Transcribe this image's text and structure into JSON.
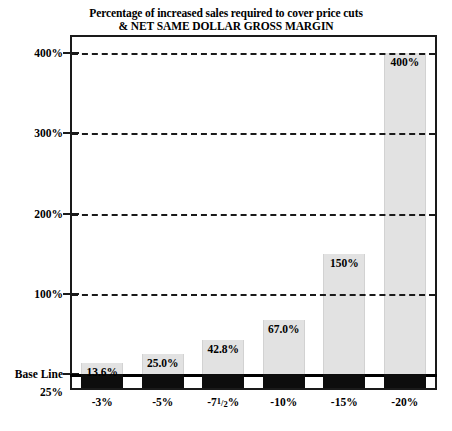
{
  "chart_data": {
    "type": "bar",
    "title": "Percentage of increased sales required to cover price cuts",
    "subtitle": "& NET SAME DOLLAR GROSS MARGIN",
    "xlabel": "",
    "ylabel": "",
    "ylim": [
      0,
      400
    ],
    "grid": true,
    "legend": "none",
    "categories": [
      "-3%",
      "-5%",
      "-7¹/₂%",
      "-10%",
      "-15%",
      "-20%"
    ],
    "category_labels_parts": [
      {
        "pre": "-3%",
        "num": "",
        "den": "",
        "post": ""
      },
      {
        "pre": "-5%",
        "num": "",
        "den": "",
        "post": ""
      },
      {
        "pre": "-7",
        "num": "1",
        "den": "2",
        "post": "%"
      },
      {
        "pre": "-10%",
        "num": "",
        "den": "",
        "post": ""
      },
      {
        "pre": "-15%",
        "num": "",
        "den": "",
        "post": ""
      },
      {
        "pre": "-20%",
        "num": "",
        "den": "",
        "post": ""
      }
    ],
    "values": [
      13.6,
      25.0,
      42.8,
      67.0,
      150,
      400
    ],
    "value_labels": [
      "13.6%",
      "25.0%",
      "42.8%",
      "67.0%",
      "150%",
      "400%"
    ],
    "yticks": [
      400,
      300,
      200,
      100,
      0
    ],
    "ytick_labels": [
      "400%",
      "300%",
      "200%",
      "100%",
      "Base Line"
    ],
    "y_below_axis_label": "25%",
    "baseline_label": "Base Line",
    "series": [
      {
        "name": "Percentage of increased sales required to cover price cuts",
        "values": [
          13.6,
          25.0,
          42.8,
          67.0,
          150,
          400
        ]
      }
    ],
    "colors": {
      "bar_above": "#e2e2e2",
      "bar_below": "#0d0d0d",
      "axis": "#1a1a1a",
      "grid": "#1a1a1a",
      "baseline": "#000000",
      "text": "#000000",
      "background": "#ffffff"
    }
  }
}
